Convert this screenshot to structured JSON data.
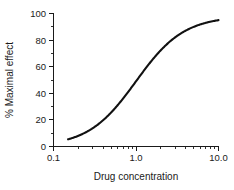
{
  "chart_data": {
    "type": "line",
    "title": "",
    "xlabel": "Drug concentration",
    "ylabel": "% Maximal effect",
    "xscale": "log",
    "xlim": [
      0.1,
      10.0
    ],
    "ylim": [
      0,
      100
    ],
    "grid": false,
    "legend": null,
    "x_ticks": [
      {
        "value": 0.1,
        "label": "0.1"
      },
      {
        "value": 1.0,
        "label": "1.0"
      },
      {
        "value": 10.0,
        "label": "10.0"
      }
    ],
    "x_minor_ticks": [
      0.2,
      0.3,
      0.4,
      0.5,
      0.6,
      0.7,
      0.8,
      0.9,
      2,
      3,
      4,
      5,
      6,
      7,
      8,
      9
    ],
    "y_ticks": [
      {
        "value": 0,
        "label": "0"
      },
      {
        "value": 20,
        "label": "20"
      },
      {
        "value": 40,
        "label": "40"
      },
      {
        "value": 60,
        "label": "60"
      },
      {
        "value": 80,
        "label": "80"
      },
      {
        "value": 100,
        "label": "100"
      }
    ],
    "y_minor_ticks": [
      10,
      30,
      50,
      70,
      90
    ],
    "series": [
      {
        "name": "Dose-response",
        "color": "#111111",
        "ec50": 1.0,
        "hill_slope": 1.5,
        "top": 98,
        "bottom": 0,
        "x": [
          0.15,
          0.18,
          0.2,
          0.25,
          0.3,
          0.35,
          0.4,
          0.5,
          0.6,
          0.7,
          0.8,
          0.9,
          1.0,
          1.2,
          1.4,
          1.6,
          1.8,
          2.0,
          2.5,
          3.0,
          3.5,
          4.0,
          5.0,
          6.0,
          7.0,
          8.0,
          9.0,
          10.0
        ],
        "y": [
          2,
          4,
          6,
          10,
          14,
          18,
          23,
          31,
          38,
          45,
          51,
          56,
          60,
          67,
          73,
          78,
          82,
          85,
          90,
          93,
          95,
          96,
          97,
          97,
          98,
          98,
          98,
          98
        ]
      }
    ]
  },
  "axis_titles": {
    "x": "Drug concentration",
    "y": "% Maximal effect"
  }
}
